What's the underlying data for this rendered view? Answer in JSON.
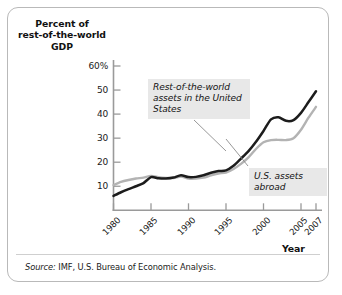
{
  "figure": {
    "y_axis_title": "Percent of\nrest-of-the-world\nGDP",
    "x_axis_title": "Year",
    "source_prefix": "Source:",
    "source_text": " IMF, U.S. Bureau of Economic Analysis.",
    "callouts": [
      {
        "id": "rest-of-world",
        "text": "Rest-of-the-world assets in the United States"
      },
      {
        "id": "us-assets-abroad",
        "text": "U.S. assets abroad"
      }
    ],
    "colors": {
      "dark_series": "#1c1c1c",
      "light_series": "#b3b3b3",
      "axis": "#9a9a9a",
      "callout_bg": "#e8e8e8",
      "frame": "#b9b9b9"
    }
  },
  "chart_data": {
    "type": "line",
    "title": "",
    "xlabel": "Year",
    "ylabel": "Percent of rest-of-the-world GDP",
    "xlim": [
      1980,
      2007
    ],
    "ylim": [
      0,
      60
    ],
    "yticks": [
      10,
      20,
      30,
      40,
      50,
      60
    ],
    "ytick_labels": [
      "10",
      "20",
      "30",
      "40",
      "50",
      "60%"
    ],
    "xticks": [
      1980,
      1985,
      1990,
      1995,
      2000,
      2005,
      2007
    ],
    "xtick_labels": [
      "1980",
      "1985",
      "1990",
      "1995",
      "2000",
      "2005",
      "2007"
    ],
    "grid": false,
    "legend": "annotations",
    "x": [
      1980,
      1981,
      1982,
      1983,
      1984,
      1985,
      1986,
      1987,
      1988,
      1989,
      1990,
      1991,
      1992,
      1993,
      1994,
      1995,
      1996,
      1997,
      1998,
      1999,
      2000,
      2001,
      2002,
      2003,
      2004,
      2005,
      2006,
      2007
    ],
    "series": [
      {
        "name": "Rest-of-the-world assets in the United States",
        "color": "#1c1c1c",
        "values": [
          6.0,
          7.5,
          8.8,
          10.0,
          11.3,
          13.8,
          13.3,
          13.2,
          13.6,
          14.6,
          13.8,
          13.9,
          14.6,
          15.6,
          16.3,
          16.6,
          18.5,
          21.5,
          24.6,
          28.5,
          33.0,
          37.8,
          38.7,
          37.2,
          37.5,
          40.5,
          45.0,
          49.5
        ]
      },
      {
        "name": "U.S. assets abroad",
        "color": "#b3b3b3",
        "values": [
          10.5,
          11.8,
          12.6,
          13.2,
          13.6,
          14.3,
          13.8,
          13.5,
          13.4,
          14.0,
          13.2,
          13.2,
          13.6,
          14.5,
          15.3,
          15.7,
          17.2,
          19.3,
          22.0,
          25.5,
          28.3,
          29.2,
          29.3,
          29.2,
          30.0,
          33.5,
          38.5,
          43.0
        ]
      }
    ]
  }
}
